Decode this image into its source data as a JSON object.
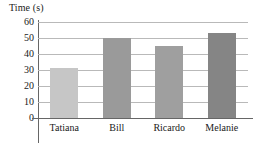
{
  "chart_data": {
    "type": "bar",
    "title": "",
    "xlabel": "",
    "ylabel": "Time (s)",
    "ylim": [
      0,
      60
    ],
    "yticks": [
      0,
      10,
      20,
      30,
      40,
      50,
      60
    ],
    "grid": true,
    "legend": "none",
    "categories": [
      "Tatiana",
      "Bill",
      "Ricardo",
      "Melanie"
    ],
    "values": [
      31,
      50,
      45,
      53
    ],
    "bar_colors": [
      "#c6c6c6",
      "#9a9a9a",
      "#9f9f9f",
      "#858585"
    ],
    "axis_color": "#666666",
    "gridline_color": "#b9b9b9"
  },
  "axis": {
    "y_title": "Time (s)",
    "tick_labels": [
      "60",
      "50",
      "40",
      "30",
      "20",
      "10",
      "0"
    ]
  }
}
